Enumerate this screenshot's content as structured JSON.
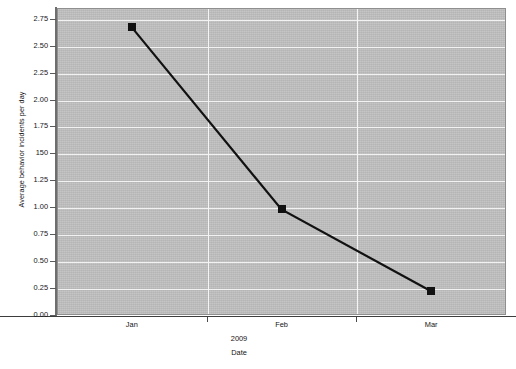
{
  "chart_data": {
    "type": "line",
    "title": "",
    "subtitle": "",
    "xlabel": "Date",
    "x_group_label": "2009",
    "ylabel": "Average behavior incidents per day",
    "categories": [
      "Jan",
      "Feb",
      "Mar"
    ],
    "series": [
      {
        "name": "Average behavior incidents per day",
        "values": [
          2.67,
          0.98,
          0.22
        ],
        "marker": "square",
        "marker_color": "#111111",
        "line_color": "#111111"
      }
    ],
    "ylim": [
      0.0,
      2.85
    ],
    "xlim": [
      0,
      3
    ],
    "ytick_labels": [
      "0.00",
      "0.25",
      "0.50",
      "0.75",
      "1.00",
      "1.25",
      "150",
      "1.75",
      "2.00",
      "2.25",
      "2.50",
      "2.75"
    ],
    "ytick_values": [
      0.0,
      0.25,
      0.5,
      0.75,
      1.0,
      1.25,
      1.5,
      1.75,
      2.0,
      2.25,
      2.5,
      2.75
    ],
    "grid": {
      "horizontal": true,
      "vertical": true,
      "horizontal_color": "#f2f2f2",
      "vertical_color": "#f5f5f5"
    },
    "legend": {
      "visible": false,
      "position": "none",
      "entries": []
    },
    "plot_background_color": "#bfbfbf",
    "figure_background_color": "#ffffff",
    "axis_color": "#4a4a4a"
  },
  "axes": {
    "y_title": "Average behavior incidents per day",
    "x_title": "Date",
    "x_group": "2009"
  }
}
